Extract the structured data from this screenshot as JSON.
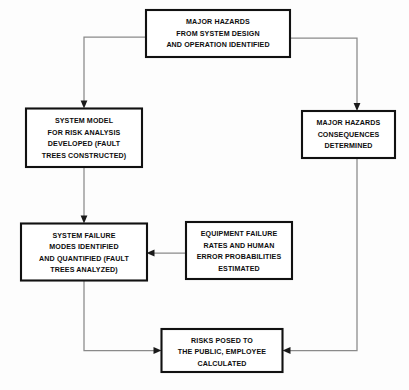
{
  "diagram": {
    "background_color": "#fdfdfd",
    "box_border_color": "#111111",
    "connector_color": "#8a8a8a",
    "text_color": "#0d0d0d",
    "nodes": [
      {
        "id": "major-hazards-identified",
        "lines": [
          "MAJOR HAZARDS",
          "FROM SYSTEM DESIGN",
          "AND OPERATION IDENTIFIED"
        ]
      },
      {
        "id": "system-model",
        "lines": [
          "SYSTEM MODEL",
          "FOR RISK ANALYSIS",
          "DEVELOPED (FAULT",
          "TREES CONSTRUCTED)"
        ]
      },
      {
        "id": "major-hazards-consequences",
        "lines": [
          "MAJOR HAZARDS",
          "CONSEQUENCES",
          "DETERMINED"
        ]
      },
      {
        "id": "system-failure-modes",
        "lines": [
          "SYSTEM FAILURE",
          "MODES IDENTIFIED",
          "AND QUANTIFIED (FAULT",
          "TREES ANALYZED)"
        ]
      },
      {
        "id": "equipment-failure-rates",
        "lines": [
          "EQUIPMENT FAILURE",
          "RATES AND HUMAN",
          "ERROR PROBABILITIES",
          "ESTIMATED"
        ]
      },
      {
        "id": "risks-posed",
        "lines": [
          "RISKS POSED TO",
          "THE PUBLIC, EMPLOYEE",
          "CALCULATED"
        ]
      }
    ],
    "edges": [
      {
        "id": "hazards-to-system-model",
        "from": "major-hazards-identified",
        "to": "system-model"
      },
      {
        "id": "hazards-to-consequences",
        "from": "major-hazards-identified",
        "to": "major-hazards-consequences"
      },
      {
        "id": "system-model-to-failure-modes",
        "from": "system-model",
        "to": "system-failure-modes"
      },
      {
        "id": "equipment-to-failure-modes",
        "from": "equipment-failure-rates",
        "to": "system-failure-modes"
      },
      {
        "id": "failure-modes-to-risks",
        "from": "system-failure-modes",
        "to": "risks-posed"
      },
      {
        "id": "consequences-to-risks",
        "from": "major-hazards-consequences",
        "to": "risks-posed"
      }
    ]
  }
}
